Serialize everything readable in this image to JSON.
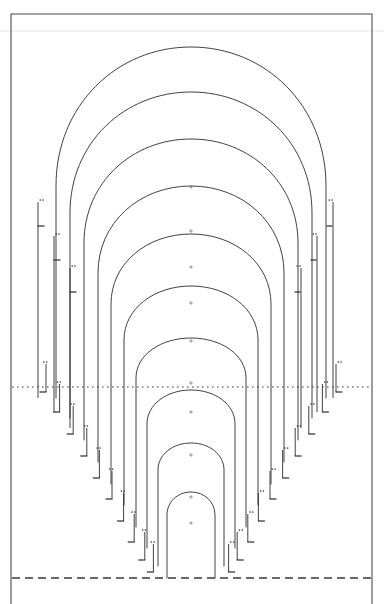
{
  "figure": {
    "title": "",
    "background_color": "#ffffff",
    "frame_color": "#4a4a4a",
    "contour_color": "#2b2b2b",
    "reference_color": "#3a3a3a",
    "width": 384,
    "height": 604
  },
  "frame": {
    "left": 11,
    "right": 372,
    "top": 14,
    "bottom": 604,
    "stroke_width": 1.1
  },
  "reference_lines": [
    {
      "name": "mid-dotted-reference",
      "style": "dotted",
      "y": 387,
      "x_start": 12,
      "x_end": 371,
      "color": "#3a3a3a"
    },
    {
      "name": "baseline-dashed",
      "style": "dashed",
      "y": 578,
      "x_start": 12,
      "x_end": 371,
      "color": "#3a3a3a"
    }
  ],
  "center_axis_x": 191,
  "chart_data": {
    "type": "line",
    "title": "",
    "xlabel": "",
    "ylabel": "",
    "grid": false,
    "legend": "none",
    "xlim": [
      11,
      372
    ],
    "ylim": [
      604,
      14
    ],
    "series": [
      {
        "name": "contour-1",
        "apex_y": 47,
        "half_width": 135,
        "leg_bottom": 398,
        "shoulder_y": 186
      },
      {
        "name": "contour-2",
        "apex_y": 92,
        "half_width": 121,
        "leg_bottom": 418,
        "shoulder_y": 213
      },
      {
        "name": "contour-3",
        "apex_y": 139,
        "half_width": 107,
        "leg_bottom": 440,
        "shoulder_y": 243
      },
      {
        "name": "contour-4",
        "apex_y": 186,
        "half_width": 93,
        "leg_bottom": 462,
        "shoulder_y": 273
      },
      {
        "name": "contour-5",
        "apex_y": 234,
        "half_width": 80,
        "leg_bottom": 484,
        "shoulder_y": 304
      },
      {
        "name": "contour-6",
        "apex_y": 286,
        "half_width": 67,
        "leg_bottom": 505,
        "shoulder_y": 340
      },
      {
        "name": "contour-7",
        "apex_y": 338,
        "half_width": 55,
        "leg_bottom": 527,
        "shoulder_y": 378
      },
      {
        "name": "contour-8",
        "apex_y": 390,
        "half_width": 44,
        "leg_bottom": 548,
        "shoulder_y": 424
      },
      {
        "name": "contour-9",
        "apex_y": 443,
        "half_width": 33,
        "leg_bottom": 566,
        "shoulder_y": 470
      },
      {
        "name": "contour-10",
        "apex_y": 492,
        "half_width": 24,
        "leg_bottom": 578,
        "shoulder_y": 515
      }
    ],
    "axis_markers_y": [
      187,
      231,
      267,
      303,
      341,
      383,
      412,
      455,
      497,
      523
    ],
    "tick_annotations": {
      "count_per_side": 10,
      "glyph": "double-dot-and-dash",
      "note": "each leg terminates in a short horizontal tick with a pair of small dots above it"
    }
  },
  "annotations": {
    "axis_tick_glyph": "plus-mark",
    "label_dot_glyph": "double-dot"
  }
}
